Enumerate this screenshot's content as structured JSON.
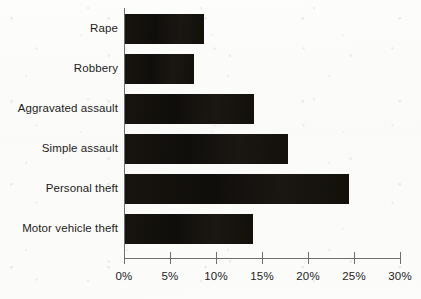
{
  "chart_data": {
    "type": "bar",
    "orientation": "horizontal",
    "title": "",
    "subtitle": "",
    "xlabel": "",
    "ylabel": "",
    "categories": [
      "Rape",
      "Robbery",
      "Aggravated assault",
      "Simple assault",
      "Personal theft",
      "Motor vehicle theft"
    ],
    "values": [
      8.6,
      7.5,
      14.0,
      17.7,
      24.3,
      13.9
    ],
    "value_unit": "%",
    "xlim": [
      0,
      30
    ],
    "xticks": [
      0,
      5,
      10,
      15,
      20,
      25,
      30
    ],
    "xtick_labels": [
      "0%",
      "5%",
      "10%",
      "15%",
      "20%",
      "25%",
      "30%"
    ],
    "grid": false,
    "legend": null,
    "bar_color": "#161310",
    "axis_color": "#6d6f6d",
    "background_color": "#fcfcfa",
    "text_color": "#1c1c1c"
  }
}
